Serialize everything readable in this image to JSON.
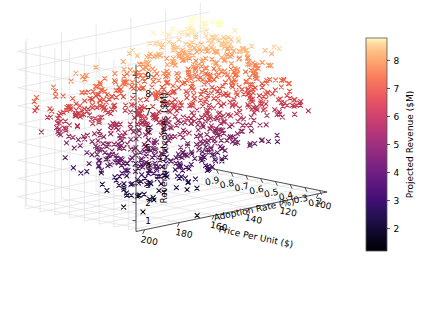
{
  "figure": {
    "background": "#ffffff",
    "marker": "x",
    "colormap": "magma",
    "grid": true,
    "projection": "3d"
  },
  "chart_data": {
    "type": "scatter",
    "title": "",
    "xlabel": "Adoption Rate (%)",
    "ylabel": "Price Per Unit ($)",
    "zlabel": "Revenue Outcomes ($M)",
    "colorbar_label": "Projected Revenue ($M)",
    "xticks": [
      "0.9",
      "0.8",
      "0.7",
      "0.6",
      "0.5",
      "0.4",
      "0.3",
      "0.2"
    ],
    "xtick_values": [
      0.9,
      0.8,
      0.7,
      0.6,
      0.5,
      0.4,
      0.3,
      0.2
    ],
    "yticks": [
      "200",
      "180",
      "160",
      "140",
      "120",
      "100"
    ],
    "ytick_values": [
      200,
      180,
      160,
      140,
      120,
      100
    ],
    "zticks": [
      "1",
      "2",
      "3",
      "4",
      "5",
      "6",
      "7",
      "8",
      "9"
    ],
    "ztick_values": [
      1,
      2,
      3,
      4,
      5,
      6,
      7,
      8,
      9
    ],
    "cbticks": [
      "2",
      "3",
      "4",
      "5",
      "6",
      "7",
      "8"
    ],
    "cbtick_values": [
      2,
      3,
      4,
      5,
      6,
      7,
      8
    ],
    "xlim": [
      0.15,
      0.95
    ],
    "ylim": [
      95,
      205
    ],
    "zlim": [
      0.4,
      9.6
    ],
    "clim": [
      1.2,
      8.8
    ],
    "n_points": 1000,
    "colormap_stops": [
      "#000004",
      "#1c1044",
      "#4f127b",
      "#812581",
      "#b5367a",
      "#e55064",
      "#fb8861",
      "#fec287",
      "#fcfdbf"
    ],
    "series": [
      {
        "name": "Projected Revenue",
        "note": "color encodes projected revenue ($M); high adoption + low price -> high revenue",
        "seed": 20250131,
        "correlation": "revenue increases with adoption rate and decreases with price per unit"
      }
    ]
  },
  "axes": {
    "x_axis_name": "adoption-rate-axis",
    "y_axis_name": "price-per-unit-axis",
    "z_axis_name": "revenue-outcomes-axis",
    "colorbar_name": "projected-revenue-colorbar"
  }
}
